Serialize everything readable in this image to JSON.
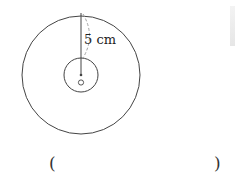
{
  "figure": {
    "outer_circle_radius_label": "5 cm",
    "center_label": "O",
    "colors": {
      "stroke": "#444444",
      "dashed": "#999999"
    }
  },
  "answer": {
    "open_bracket": "(",
    "close_bracket": ")",
    "value": ""
  }
}
